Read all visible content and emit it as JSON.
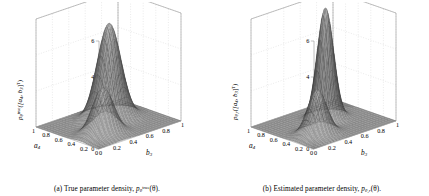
{
  "figure": {
    "background": "#ffffff",
    "panels": [
      {
        "id": "panel-a",
        "caption_prefix": "(a)",
        "caption_text": "True parameter density,",
        "caption_sym": "p",
        "caption_sym_sub": "θ",
        "caption_sym_sup": "true",
        "caption_sym_arg": "(θ).",
        "ylabel_sym": "p",
        "ylabel_sub": "θ",
        "ylabel_sup": "true",
        "ylabel_arg": "([a",
        "ylabel_arg_sub1": "4",
        "ylabel_arg_mid": ", b",
        "ylabel_arg_sub2": "3",
        "ylabel_arg_end": "]",
        "ylabel_arg_sup": "T",
        "ylabel_arg_close": ")",
        "xaxis_name": "a",
        "xaxis_name_sub": "4",
        "yaxis_name": "b",
        "yaxis_name_sub": "3",
        "chart_data": {
          "type": "surface",
          "title": "True parameter density",
          "xlabel": "a_4",
          "ylabel": "b_3",
          "zlabel": "p_theta^true([a_4, b_3]^T)",
          "xlim": [
            0,
            1
          ],
          "ylim": [
            0,
            1
          ],
          "zlim": [
            0,
            6
          ],
          "xticks": [
            "0",
            "0.2",
            "0.4",
            "0.6",
            "0.8",
            "1"
          ],
          "yticks": [
            "0",
            "0.2",
            "0.4",
            "0.6",
            "0.8",
            "1"
          ],
          "zticks": [
            "0",
            "2",
            "4",
            "6"
          ],
          "grid": true,
          "legend": "none",
          "colormap": "gray-mesh",
          "mixture": [
            {
              "name": "peak-1",
              "weight": 0.38,
              "mx": 0.3,
              "my": 0.28,
              "sx": 0.105,
              "sy": 0.105,
              "rho": 0.0,
              "peak_height": 2.6
            },
            {
              "name": "peak-2",
              "weight": 0.62,
              "mx": 0.62,
              "my": 0.6,
              "sx": 0.115,
              "sy": 0.115,
              "rho": 0.0,
              "peak_height": 5.3
            }
          ]
        }
      },
      {
        "id": "panel-b",
        "caption_prefix": "(b)",
        "caption_text": "Estimated parameter density,",
        "caption_sym": "p",
        "caption_sym_sub": "θ,r",
        "caption_sym_sup": "",
        "caption_sym_arg": "(θ).",
        "ylabel_sym": "p",
        "ylabel_sub": "θ,r",
        "ylabel_sup": "",
        "ylabel_arg": "([a",
        "ylabel_arg_sub1": "4",
        "ylabel_arg_mid": ", b",
        "ylabel_arg_sub2": "3",
        "ylabel_arg_end": "]",
        "ylabel_arg_sup": "T",
        "ylabel_arg_close": ")",
        "xaxis_name": "a",
        "xaxis_name_sub": "4",
        "yaxis_name": "b",
        "yaxis_name_sub": "3",
        "chart_data": {
          "type": "surface",
          "title": "Estimated parameter density",
          "xlabel": "a_4",
          "ylabel": "b_3",
          "zlabel": "p_{theta,r}([a_4, b_3]^T)",
          "xlim": [
            0,
            1
          ],
          "ylim": [
            0,
            1
          ],
          "zlim": [
            0,
            6
          ],
          "xticks": [
            "0",
            "0.2",
            "0.4",
            "0.6",
            "0.8",
            "1"
          ],
          "yticks": [
            "0",
            "0.2",
            "0.4",
            "0.6",
            "0.8",
            "1"
          ],
          "zticks": [
            "0",
            "2",
            "4",
            "6"
          ],
          "grid": true,
          "legend": "none",
          "colormap": "gray-mesh",
          "mixture": [
            {
              "name": "peak-1",
              "weight": 0.3,
              "mx": 0.3,
              "my": 0.27,
              "sx": 0.095,
              "sy": 0.095,
              "rho": 0.0,
              "peak_height": 2.5
            },
            {
              "name": "peak-2",
              "weight": 0.7,
              "mx": 0.6,
              "my": 0.6,
              "sx": 0.08,
              "sy": 0.08,
              "rho": 0.0,
              "peak_height": 6.2
            }
          ]
        }
      }
    ]
  }
}
